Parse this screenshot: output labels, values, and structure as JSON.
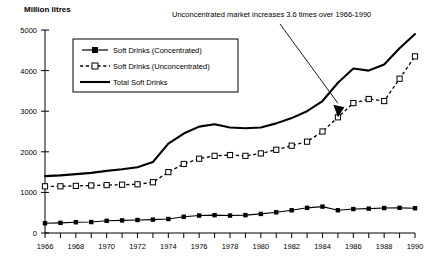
{
  "chart_data": {
    "type": "line",
    "title": "",
    "ylabel": "Million litres",
    "xlabel": "",
    "ylim": [
      0,
      5000
    ],
    "xlim": [
      1966,
      1990
    ],
    "grid": false,
    "legend_position": "top-left-inside",
    "y_ticks": [
      "0",
      "1000",
      "2000",
      "3000",
      "4000",
      "5000"
    ],
    "x_ticks": [
      "1966",
      "1968",
      "1970",
      "1972",
      "1974",
      "1976",
      "1978",
      "1980",
      "1982",
      "1984",
      "1986",
      "1988",
      "1990"
    ],
    "x_tick_step_minor": 1,
    "x": [
      1966,
      1967,
      1968,
      1969,
      1970,
      1971,
      1972,
      1973,
      1974,
      1975,
      1976,
      1977,
      1978,
      1979,
      1980,
      1981,
      1982,
      1983,
      1984,
      1985,
      1986,
      1987,
      1988,
      1989,
      1990
    ],
    "annotations": [
      {
        "name": "unconcentrated-growth-note",
        "text": "Unconcentrated market increases 3.6 times over 1966-1990",
        "target_year": 1985,
        "target_value": 2850
      }
    ],
    "series": [
      {
        "name": "Soft Drinks (Concentrated)",
        "marker": "filled-square",
        "line_style": "solid",
        "values": [
          240,
          250,
          265,
          270,
          300,
          310,
          320,
          330,
          345,
          400,
          430,
          440,
          430,
          440,
          470,
          510,
          560,
          620,
          650,
          560,
          590,
          600,
          615,
          620,
          610
        ]
      },
      {
        "name": "Soft Drinks (Unconcentrated)",
        "marker": "open-square",
        "line_style": "dashed",
        "values": [
          1150,
          1150,
          1160,
          1170,
          1180,
          1190,
          1200,
          1250,
          1500,
          1700,
          1830,
          1900,
          1920,
          1900,
          1960,
          2050,
          2150,
          2250,
          2500,
          2850,
          3200,
          3300,
          3250,
          3800,
          4350
        ]
      },
      {
        "name": "Total Soft Drinks",
        "marker": "none",
        "line_style": "solid-thick",
        "values": [
          1400,
          1420,
          1450,
          1480,
          1530,
          1570,
          1620,
          1750,
          2200,
          2450,
          2620,
          2680,
          2600,
          2580,
          2600,
          2700,
          2830,
          3000,
          3250,
          3700,
          4050,
          4000,
          4150,
          4550,
          4900
        ]
      }
    ]
  },
  "legend": {
    "items": [
      {
        "label": "Soft Drinks (Concentrated)"
      },
      {
        "label": "Soft Drinks (Unconcentrated)"
      },
      {
        "label": "Total Soft Drinks"
      }
    ]
  }
}
